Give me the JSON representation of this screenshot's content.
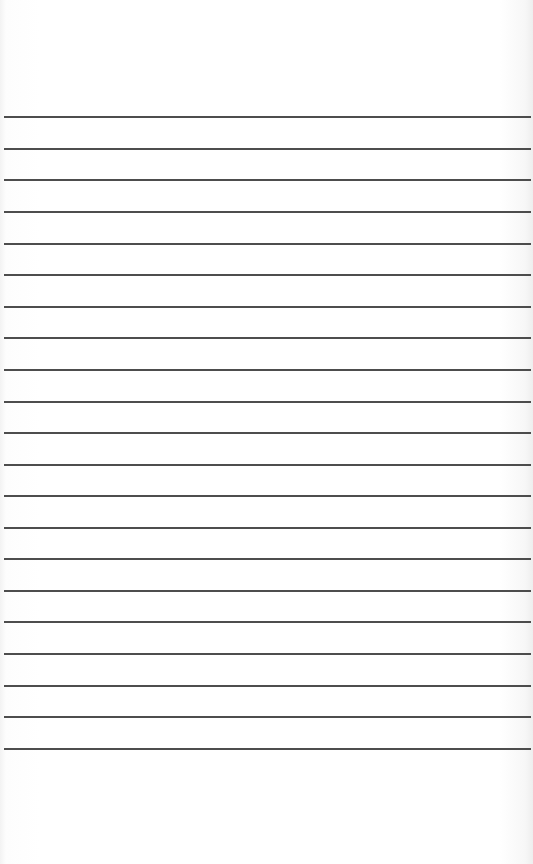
{
  "page": {
    "type": "lined-paper",
    "background_color": "#ffffff",
    "line_color": "#3a3a3a",
    "line_count": 21,
    "line_positions_y": [
      116,
      148,
      179,
      211,
      243,
      274,
      306,
      337,
      369,
      401,
      432,
      464,
      495,
      527,
      558,
      590,
      621,
      653,
      685,
      716,
      748
    ],
    "line_left_x": 4,
    "line_right_x": 531
  }
}
